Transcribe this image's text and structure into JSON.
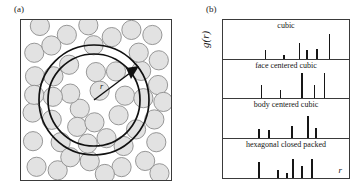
{
  "figure": {
    "panel_a": {
      "label": "(a)",
      "r_annotation": "r",
      "description": "hard-sphere packing with concentric shell rings"
    },
    "panel_b": {
      "label": "(b)",
      "ylabel": "g(r)",
      "xlabel": "r"
    }
  },
  "chart_data": {
    "type": "bar",
    "xlabel": "r",
    "ylabel": "g(r)",
    "grid": false,
    "legend_position": "none",
    "xlim": [
      0,
      1
    ],
    "ylim": [
      0,
      1
    ],
    "panels": [
      {
        "name": "cubic",
        "label": "cubic",
        "x": [
          0.33,
          0.48,
          0.6,
          0.66,
          0.74,
          0.84
        ],
        "values": [
          0.22,
          0.09,
          0.4,
          0.22,
          0.24,
          0.62
        ]
      },
      {
        "name": "face-centered-cubic",
        "label": "face centered cubic",
        "x": [
          0.3,
          0.45,
          0.62,
          0.72,
          0.8
        ],
        "values": [
          0.33,
          0.2,
          0.63,
          0.33,
          0.62
        ]
      },
      {
        "name": "body-centered-cubic",
        "label": "body centered cubic",
        "x": [
          0.28,
          0.36,
          0.54,
          0.67,
          0.73
        ],
        "values": [
          0.22,
          0.2,
          0.28,
          0.55,
          0.25
        ]
      },
      {
        "name": "hexagonal-closed-packed",
        "label": "hexagonal closed packed",
        "x": [
          0.28,
          0.43,
          0.5,
          0.55,
          0.62,
          0.7
        ],
        "values": [
          0.4,
          0.2,
          0.12,
          0.48,
          0.3,
          0.47
        ]
      }
    ]
  }
}
